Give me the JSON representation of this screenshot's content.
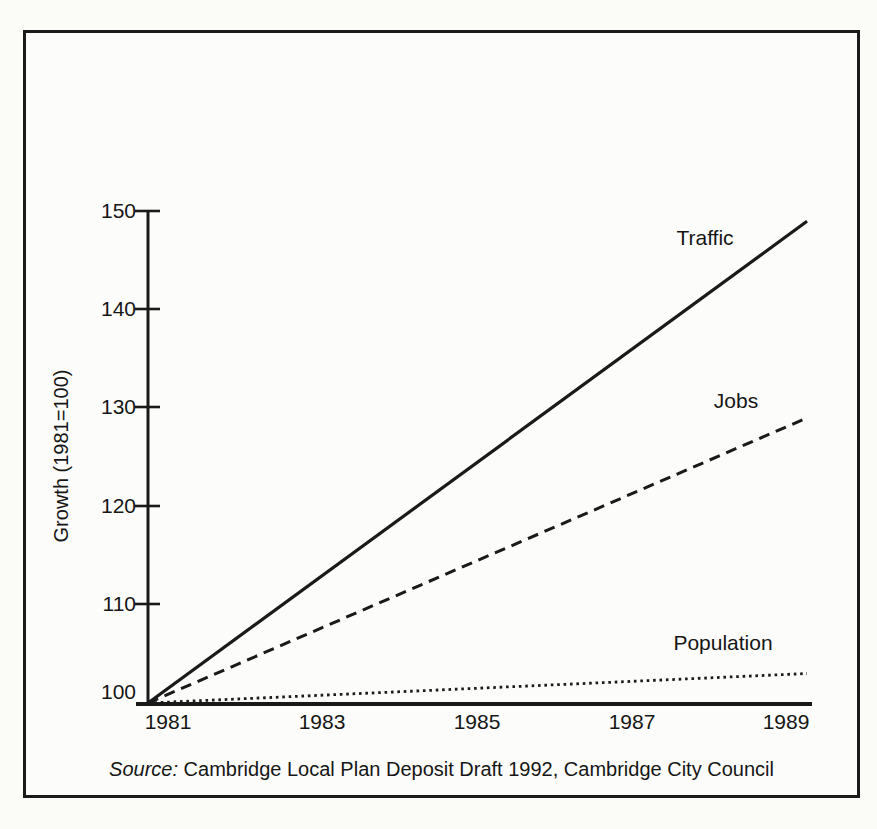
{
  "figure": {
    "source_prefix": "Source:",
    "source_text": " Cambridge Local Plan Deposit Draft 1992, Cambridge City Council"
  },
  "chart_data": {
    "type": "line",
    "title": "",
    "xlabel": "",
    "ylabel": "Growth (1981=100)",
    "x": [
      1981,
      1989
    ],
    "xlim": [
      1981,
      1989
    ],
    "ylim": [
      100,
      150
    ],
    "x_tick_labels": [
      "1981",
      "1983",
      "1985",
      "1987",
      "1989"
    ],
    "y_tick_labels": [
      "100",
      "110",
      "120",
      "130",
      "140",
      "150"
    ],
    "grid": false,
    "legend": "inline-labels-near-lines",
    "series": [
      {
        "name": "Traffic",
        "line_style": "solid",
        "values": [
          100,
          149
        ]
      },
      {
        "name": "Jobs",
        "line_style": "dashed",
        "values": [
          100,
          129
        ]
      },
      {
        "name": "Population",
        "line_style": "dotted",
        "values": [
          100,
          103
        ]
      }
    ],
    "colors": {
      "line": "#1a1a1a",
      "paper": "#fcfcfa",
      "ink": "#161616"
    }
  }
}
